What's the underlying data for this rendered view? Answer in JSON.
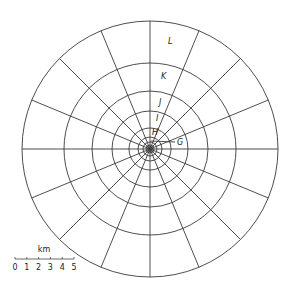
{
  "diagram": {
    "center": [
      150,
      149
    ],
    "ring_radii": [
      128,
      86,
      58,
      38,
      21,
      12,
      7,
      4,
      2.5
    ],
    "spoke_count": 16,
    "stroke_color": "#3a3a3a",
    "zone_labels": [
      {
        "id": "L",
        "text": "L",
        "x": 168,
        "y": 44
      },
      {
        "id": "K",
        "text": "K",
        "x": 161,
        "y": 79
      },
      {
        "id": "J",
        "text": "J",
        "x": 159,
        "y": 105
      },
      {
        "id": "I",
        "text": "I",
        "x": 156,
        "y": 121
      },
      {
        "id": "H",
        "text": "H",
        "x": 152,
        "y": 135
      },
      {
        "id": "G",
        "text": "G",
        "x": 177,
        "y": 145
      }
    ],
    "g_leader": {
      "x1": 151,
      "y1": 141,
      "x2": 175,
      "y2": 142
    }
  },
  "scale_bar": {
    "unit": "km",
    "ticks": [
      "0",
      "1",
      "2",
      "3",
      "4",
      "5"
    ],
    "x_start": 15,
    "x_end": 74,
    "y": 259
  }
}
